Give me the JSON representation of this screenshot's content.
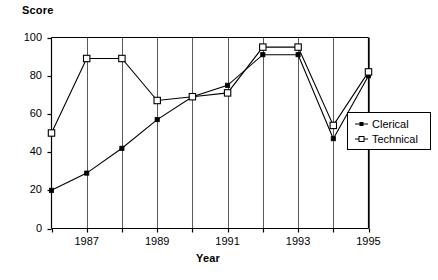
{
  "chart_data": {
    "type": "line",
    "title": "",
    "xlabel": "Year",
    "ylabel": "Score",
    "x": [
      1986,
      1987,
      1988,
      1989,
      1990,
      1991,
      1992,
      1993,
      1994,
      1995
    ],
    "xtick_labels": [
      "",
      "1987",
      "",
      "1989",
      "",
      "1991",
      "",
      "1993",
      "",
      "1995"
    ],
    "xlim": [
      1986,
      1995
    ],
    "ylim": [
      0,
      100
    ],
    "ytick_labels": [
      "0",
      "20",
      "40",
      "60",
      "80",
      "100"
    ],
    "yticks": [
      0,
      20,
      40,
      60,
      80,
      100
    ],
    "grid": "vertical",
    "legend_position": "right-outside",
    "series": [
      {
        "name": "Clerical",
        "marker": "filled-diamond",
        "values": [
          20,
          29,
          42,
          57,
          69,
          75,
          91,
          91,
          47,
          80
        ]
      },
      {
        "name": "Technical",
        "marker": "open-square",
        "values": [
          50,
          89,
          89,
          67,
          69,
          71,
          95,
          95,
          54,
          82
        ]
      }
    ]
  },
  "axes": {
    "y_title": "Score",
    "x_title": "Year"
  },
  "legend": {
    "items": [
      {
        "label": "Clerical",
        "marker": "filled-diamond-icon"
      },
      {
        "label": "Technical",
        "marker": "open-square-icon"
      }
    ]
  }
}
